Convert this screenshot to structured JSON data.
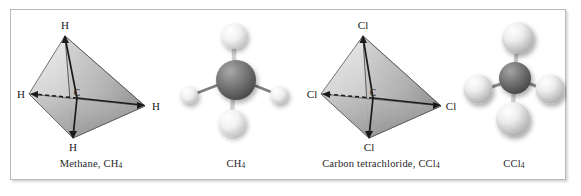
{
  "figure": {
    "background_color": "#ffffff",
    "frame_border_color": "#b9b9bb",
    "panel_count": 4
  },
  "panels": [
    {
      "id": "methane-tetrahedron",
      "type": "tetrahedron-diagram",
      "caption_name": "Methane",
      "caption_formula": "CH",
      "caption_subscript": "4",
      "caption_full": "Methane, CH4",
      "center_atom_label": "C",
      "vertex_labels": [
        "H",
        "H",
        "H",
        "H"
      ],
      "vertex_positions": [
        "top",
        "left",
        "right",
        "bottom"
      ]
    },
    {
      "id": "methane-ball-and-stick",
      "type": "ball-and-stick-model",
      "caption_formula": "CH",
      "caption_subscript": "4",
      "caption_full": "CH4",
      "center_atom": "C",
      "outer_atoms": [
        "H",
        "H",
        "H",
        "H"
      ],
      "center_color": "#6f6f6f",
      "outer_color": "#e8e8e8"
    },
    {
      "id": "carbon-tetrachloride-tetrahedron",
      "type": "tetrahedron-diagram",
      "caption_name": "Carbon tetrachloride",
      "caption_formula": "CCl",
      "caption_subscript": "4",
      "caption_full": "Carbon tetrachloride, CCl4",
      "center_atom_label": "C",
      "vertex_labels": [
        "Cl",
        "Cl",
        "Cl",
        "Cl"
      ],
      "vertex_positions": [
        "top",
        "left",
        "right",
        "bottom"
      ]
    },
    {
      "id": "carbon-tetrachloride-ball-and-stick",
      "type": "ball-and-stick-model",
      "caption_formula": "CCl",
      "caption_subscript": "4",
      "caption_full": "CCl4",
      "center_atom": "C",
      "outer_atoms": [
        "Cl",
        "Cl",
        "Cl",
        "Cl"
      ],
      "center_color": "#6f6f6f",
      "outer_color": "#d9d9d9"
    }
  ]
}
